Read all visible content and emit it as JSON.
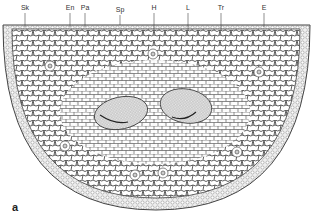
{
  "figure": {
    "panel_label": "a",
    "labels": [
      {
        "text": "Sk",
        "x": 25,
        "y": 4,
        "lineTo": 25
      },
      {
        "text": "En",
        "x": 70,
        "y": 4,
        "lineTo": 26
      },
      {
        "text": "Pa",
        "x": 85,
        "y": 4,
        "lineTo": 26
      },
      {
        "text": "Sp",
        "x": 120,
        "y": 6,
        "lineTo": 24
      },
      {
        "text": "H",
        "x": 154,
        "y": 4,
        "lineTo": 22
      },
      {
        "text": "L",
        "x": 188,
        "y": 4,
        "lineTo": 22
      },
      {
        "text": "Tr",
        "x": 221,
        "y": 4,
        "lineTo": 22
      },
      {
        "text": "E",
        "x": 264,
        "y": 4,
        "lineTo": 25
      }
    ]
  }
}
